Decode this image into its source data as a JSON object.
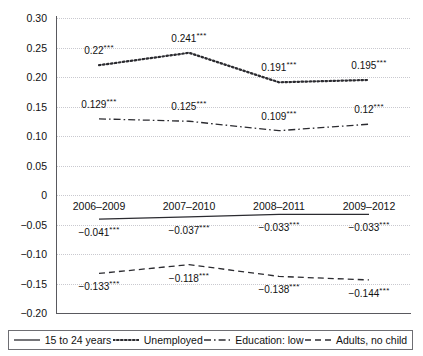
{
  "chart_data": {
    "type": "line",
    "title": "",
    "subtitle": "",
    "xlabel": "",
    "ylabel": "",
    "categories": [
      "2006–2009",
      "2007–2010",
      "2008–2011",
      "2009–2012"
    ],
    "ylim": [
      -0.2,
      0.3
    ],
    "ytick_values": [
      0.3,
      0.25,
      0.2,
      0.15,
      0.1,
      0.05,
      0,
      -0.05,
      -0.1,
      -0.15,
      -0.2
    ],
    "ytick_labels": [
      "0.30",
      "0.25",
      "0.20",
      "0.15",
      "0.10",
      "0.05",
      "0",
      "−0.05",
      "−0.10",
      "−0.15",
      "−0.20"
    ],
    "grid": true,
    "grid_style": "dotted-horizontal",
    "legend_position": "bottom",
    "significance_marker": "***",
    "series": [
      {
        "name": "15 to 24 years",
        "line_style": "solid",
        "values": [
          -0.041,
          -0.037,
          -0.033,
          -0.033
        ],
        "point_labels": [
          "−0.041",
          "−0.037",
          "−0.033",
          "−0.033"
        ],
        "label_suffix": [
          "***",
          "***",
          "***",
          "***"
        ],
        "label_position": "below"
      },
      {
        "name": "Unemployed",
        "line_style": "dotted",
        "values": [
          0.22,
          0.241,
          0.191,
          0.195
        ],
        "point_labels": [
          "0.22",
          "0.241",
          "0.191",
          "0.195"
        ],
        "label_suffix": [
          "***",
          "***",
          "***",
          "***"
        ],
        "label_position": "above"
      },
      {
        "name": "Education: low",
        "line_style": "dash-dot",
        "values": [
          0.129,
          0.125,
          0.109,
          0.12
        ],
        "point_labels": [
          "0.129",
          "0.125",
          "0.109",
          "0.12"
        ],
        "label_suffix": [
          "***",
          "***",
          "***",
          "***"
        ],
        "label_position": "above"
      },
      {
        "name": "Adults, no child",
        "line_style": "dashed",
        "values": [
          -0.133,
          -0.118,
          -0.138,
          -0.144
        ],
        "point_labels": [
          "−0.133",
          "−0.118",
          "−0.138",
          "−0.144"
        ],
        "label_suffix": [
          "***",
          "***",
          "***",
          "***"
        ],
        "label_position": "below"
      }
    ]
  },
  "legend": {
    "items": [
      {
        "label": "15 to 24 years",
        "style": "solid"
      },
      {
        "label": "Unemployed",
        "style": "dotted"
      },
      {
        "label": "Education: low",
        "style": "dash-dot"
      },
      {
        "label": "Adults, no child",
        "style": "dashed"
      }
    ]
  },
  "colors": {
    "line": "#2b2b30",
    "grid": "#c9c9cf",
    "axis": "#59595e",
    "text": "#111111",
    "background": "#ffffff"
  }
}
